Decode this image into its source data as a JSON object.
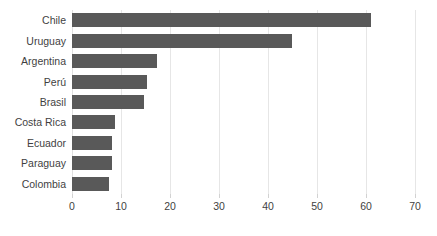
{
  "chart_data": {
    "type": "bar",
    "orientation": "horizontal",
    "title": "",
    "subtitle": "",
    "xlabel": "",
    "ylabel": "",
    "categories": [
      "Chile",
      "Uruguay",
      "Argentina",
      "Perú",
      "Brasil",
      "Costa Rica",
      "Ecuador",
      "Paraguay",
      "Colombia"
    ],
    "values": [
      61,
      44.8,
      17.4,
      15.3,
      14.6,
      8.8,
      8.2,
      8.2,
      7.6
    ],
    "series": [
      {
        "name": "",
        "values": [
          61,
          44.8,
          17.4,
          15.3,
          14.6,
          8.8,
          8.2,
          8.2,
          7.6
        ]
      }
    ],
    "xlim": [
      0,
      70
    ],
    "xticks": [
      0,
      10,
      20,
      30,
      40,
      50,
      60,
      70
    ],
    "xtick_labels": [
      "0",
      "10",
      "20",
      "30",
      "40",
      "50",
      "60",
      "70"
    ],
    "grid": "vertical",
    "legend": "none",
    "bar_color": "#595959",
    "grid_color": "#e6e6e6",
    "text_color": "#3f3f3f",
    "background_color": "#ffffff"
  }
}
